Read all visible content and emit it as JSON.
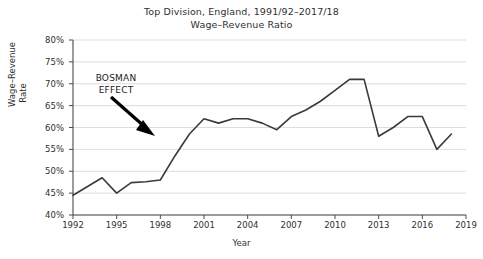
{
  "chart_data": {
    "type": "line",
    "title": "Top Division, England, 1991/92–2017/18",
    "subtitle": "Wage–Revenue Ratio",
    "xlabel": "Year",
    "ylabel_line1": "Wage–Revenue",
    "ylabel_line2": "Rate",
    "xlim": [
      1992,
      2019
    ],
    "ylim": [
      40,
      80
    ],
    "grid": "horizontal",
    "legend": "none",
    "line_color": "#3a3a3a",
    "grid_color": "#d4d4d4",
    "axis_color": "#4a4a4a",
    "ytick_labels": [
      "80%",
      "75%",
      "70%",
      "65%",
      "60%",
      "55%",
      "50%",
      "45%",
      "40%"
    ],
    "ytick_values": [
      80,
      75,
      70,
      65,
      60,
      55,
      50,
      45,
      40
    ],
    "xtick_labels": [
      "1992",
      "1995",
      "1998",
      "2001",
      "2004",
      "2007",
      "2010",
      "2013",
      "2016",
      "2019"
    ],
    "xtick_values": [
      1992,
      1995,
      1998,
      2001,
      2004,
      2007,
      2010,
      2013,
      2016,
      2019
    ],
    "x": [
      1992,
      1993,
      1994,
      1995,
      1996,
      1997,
      1998,
      1999,
      2000,
      2001,
      2002,
      2003,
      2004,
      2005,
      2006,
      2007,
      2008,
      2009,
      2010,
      2011,
      2012,
      2013,
      2014,
      2015,
      2016,
      2017,
      2018
    ],
    "values": [
      44.5,
      46.5,
      48.5,
      45.0,
      47.4,
      47.6,
      48.0,
      53.5,
      58.5,
      62.0,
      61.0,
      62.0,
      62.0,
      61.0,
      59.5,
      62.5,
      64.0,
      66.0,
      68.5,
      71.0,
      71.0,
      58.0,
      60.0,
      62.5,
      62.5,
      55.0,
      58.5
    ],
    "annotations": [
      {
        "text_line1": "BOSMAN",
        "text_line2": "EFFECT",
        "arrow": "down-right",
        "points_to_year": 1998,
        "points_to_value": 57.5
      }
    ]
  }
}
